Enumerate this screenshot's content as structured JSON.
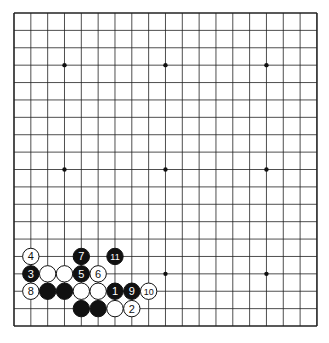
{
  "board": {
    "size": 19,
    "left": 14,
    "top": 13,
    "dx": 16.83,
    "dy": 17.39,
    "stars": [
      [
        3,
        3
      ],
      [
        9,
        3
      ],
      [
        15,
        3
      ],
      [
        3,
        9
      ],
      [
        9,
        9
      ],
      [
        15,
        9
      ],
      [
        3,
        15
      ],
      [
        9,
        15
      ],
      [
        15,
        15
      ]
    ],
    "stones": [
      {
        "c": "b",
        "x": 4,
        "y": 17,
        "n": ""
      },
      {
        "c": "b",
        "x": 5,
        "y": 17,
        "n": ""
      },
      {
        "c": "w",
        "x": 6,
        "y": 17,
        "n": ""
      },
      {
        "c": "w",
        "x": 7,
        "y": 17,
        "n": "2"
      },
      {
        "c": "w",
        "x": 1,
        "y": 16,
        "n": "8"
      },
      {
        "c": "b",
        "x": 2,
        "y": 16,
        "n": ""
      },
      {
        "c": "b",
        "x": 3,
        "y": 16,
        "n": ""
      },
      {
        "c": "w",
        "x": 4,
        "y": 16,
        "n": ""
      },
      {
        "c": "w",
        "x": 5,
        "y": 16,
        "n": ""
      },
      {
        "c": "b",
        "x": 6,
        "y": 16,
        "n": "1"
      },
      {
        "c": "b",
        "x": 7,
        "y": 16,
        "n": "9"
      },
      {
        "c": "w",
        "x": 8,
        "y": 16,
        "n": "10"
      },
      {
        "c": "b",
        "x": 1,
        "y": 15,
        "n": "3"
      },
      {
        "c": "w",
        "x": 2,
        "y": 15,
        "n": ""
      },
      {
        "c": "w",
        "x": 3,
        "y": 15,
        "n": ""
      },
      {
        "c": "b",
        "x": 4,
        "y": 15,
        "n": "5"
      },
      {
        "c": "w",
        "x": 5,
        "y": 15,
        "n": "6"
      },
      {
        "c": "w",
        "x": 1,
        "y": 14,
        "n": "4"
      },
      {
        "c": "b",
        "x": 4,
        "y": 14,
        "n": "7"
      },
      {
        "c": "b",
        "x": 6,
        "y": 14,
        "n": "11"
      }
    ]
  }
}
